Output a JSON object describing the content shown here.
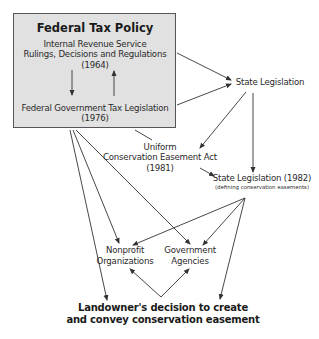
{
  "diagram": {
    "federal_box": {
      "title": "Federal Tax Policy",
      "irs_line1": "Internal Revenue Service",
      "irs_line2": "Rulings, Decisions and Regulations",
      "irs_year": "(1964)",
      "fed_line1": "Federal Government Tax Legislation",
      "fed_year": "(1976)"
    },
    "state_legislation": "State Legislation",
    "uniform_act": {
      "line1": "Uniform",
      "line2": "Conservation Easement Act",
      "year": "(1981)"
    },
    "state_1982": {
      "label": "State Legislation (1982)",
      "subtitle": "(defining conservation easements)"
    },
    "nonprofit": {
      "line1": "Nonprofit",
      "line2": "Organizations"
    },
    "government": {
      "line1": "Government",
      "line2": "Agencies"
    },
    "landowner": {
      "line1": "Landowner's decision to create",
      "line2": "and convey conservation easement"
    },
    "colors": {
      "box_fill": "#e1e1e1",
      "line": "#333333"
    }
  }
}
